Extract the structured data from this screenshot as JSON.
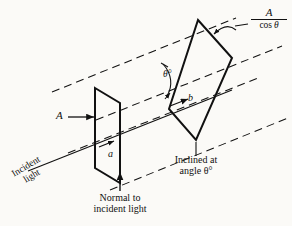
{
  "figure": {
    "type": "optics-diagram",
    "background_color": "#fbfaf7",
    "ink_color": "#111111"
  },
  "labels": {
    "area_normal": "A",
    "area_inclined_numerator": "A",
    "area_inclined_denominator_cos": "cos",
    "area_inclined_denominator_theta": "θ",
    "side_a": "a",
    "side_b": "b",
    "angle_theta": "θ°",
    "incident_light_line1": "Incident",
    "incident_light_line2": "light",
    "normal_caption_line1": "Normal to",
    "normal_caption_line2": "incident light",
    "inclined_caption_line1": "Inclined at",
    "inclined_caption_line2": "angle θ°"
  },
  "geometry": {
    "normal_surface_vertices": "95,88 120,103 120,183 95,168",
    "inclined_surface_vertices": "198,20 232,58 196,140 169,109",
    "ray_angle_degrees": -22,
    "incident_text_rotation_degrees": -31
  },
  "icons": {
    "area_arrow": "arrow-right-icon",
    "leader_arrow": "leader-arrow-icon",
    "normal_pointer": "arrow-down-icon",
    "inclined_pointer": "arrow-up-icon",
    "angle_arc": "angle-arc-icon",
    "ray_direction": "arrow-right-icon"
  },
  "bleed_through": {
    "line1": "",
    "line2": ""
  }
}
